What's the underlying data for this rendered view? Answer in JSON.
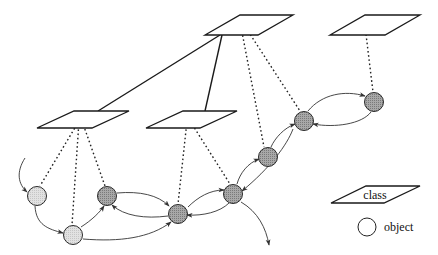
{
  "diagram": {
    "type": "class-object hierarchy",
    "colors": {
      "light_object": "#d9d9d9",
      "dark_object": "#9a9a9a",
      "line": "#1a1a1a"
    },
    "classes": [
      {
        "id": "top",
        "pts": "205,35 258,35 293,15 240,15"
      },
      {
        "id": "right",
        "pts": "330,35 385,35 420,15 365,15"
      },
      {
        "id": "left",
        "pts": "37,128 92,128 129,111 74,111"
      },
      {
        "id": "middle",
        "pts": "146,128 200,128 237,111 183,111"
      }
    ],
    "objects": [
      {
        "id": "o1",
        "cx": 37,
        "cy": 196,
        "shade": "light"
      },
      {
        "id": "o2",
        "cx": 73,
        "cy": 235,
        "shade": "light"
      },
      {
        "id": "o3",
        "cx": 107,
        "cy": 196,
        "shade": "dark"
      },
      {
        "id": "o4",
        "cx": 178,
        "cy": 214,
        "shade": "dark"
      },
      {
        "id": "o5",
        "cx": 233,
        "cy": 194,
        "shade": "dark"
      },
      {
        "id": "o6",
        "cx": 268,
        "cy": 157,
        "shade": "dark"
      },
      {
        "id": "o7",
        "cx": 304,
        "cy": 121,
        "shade": "dark"
      },
      {
        "id": "o8",
        "cx": 374,
        "cy": 102,
        "shade": "dark"
      }
    ]
  },
  "legend": {
    "class_label": "class",
    "object_label": "object"
  }
}
